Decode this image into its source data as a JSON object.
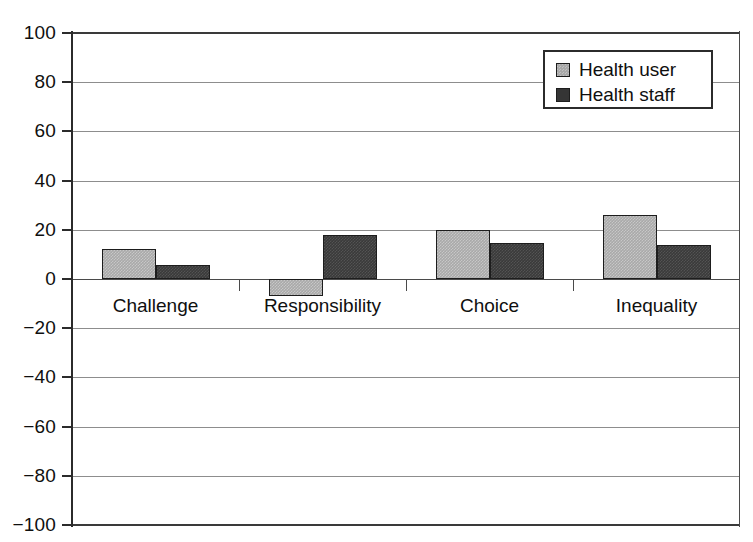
{
  "chart_data": {
    "type": "bar",
    "title": "",
    "xlabel": "",
    "ylabel": "",
    "ylim": [
      -100,
      100
    ],
    "grid": true,
    "legend_position": "top-right-inside",
    "categories": [
      "Challenge",
      "Responsibility",
      "Choice",
      "Inequality"
    ],
    "yticks": [
      "100",
      "80",
      "60",
      "40",
      "20",
      "0",
      "−20",
      "−40",
      "−60",
      "−80",
      "−100"
    ],
    "ytick_values": [
      100,
      80,
      60,
      40,
      20,
      0,
      -20,
      -40,
      -60,
      -80,
      -100
    ],
    "series": [
      {
        "name": "Health user",
        "color": "#a9a9a9",
        "values": [
          12,
          -7,
          20,
          26
        ]
      },
      {
        "name": "Health staff",
        "color": "#3a3a3a",
        "values": [
          5.5,
          18,
          14.5,
          14
        ]
      }
    ]
  },
  "legend": {
    "entries": [
      {
        "label": "Health user"
      },
      {
        "label": "Health staff"
      }
    ]
  }
}
